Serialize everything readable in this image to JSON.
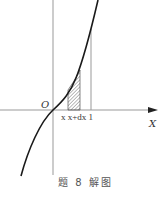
{
  "figure": {
    "caption": "题 8 解图",
    "origin_label": "O",
    "x_axis_label": "X",
    "tick_labels": "x x+dx 1"
  },
  "colors": {
    "axis": "#888888",
    "curve": "#1a1a1a",
    "hatch": "#555555"
  }
}
